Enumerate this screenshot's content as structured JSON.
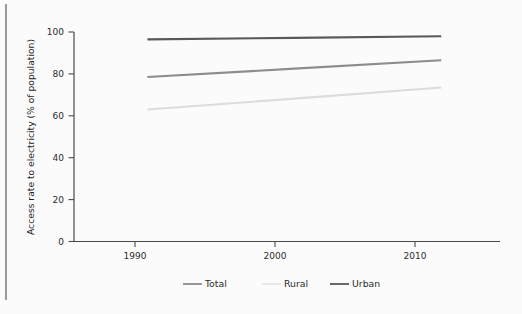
{
  "chart_data": {
    "type": "line",
    "title": "",
    "xlabel": "",
    "ylabel": "Access rate to electricity (% of population)",
    "x": [
      1990,
      2000,
      2010
    ],
    "xlim": [
      1985,
      2014
    ],
    "ylim": [
      0,
      100
    ],
    "xticks": [
      "1990",
      "2000",
      "2010"
    ],
    "yticks": [
      "0",
      "20",
      "40",
      "60",
      "80",
      "100"
    ],
    "grid": false,
    "legend_position": "bottom",
    "series": [
      {
        "name": "Total",
        "values": [
          78.5,
          82.5,
          86.5
        ],
        "color": "#8c8c8c"
      },
      {
        "name": "Rural",
        "values": [
          63.0,
          68.2,
          73.5
        ],
        "color": "#dcdcdc"
      },
      {
        "name": "Urban",
        "values": [
          96.5,
          97.2,
          98.0
        ],
        "color": "#59595b"
      }
    ]
  },
  "axis": {
    "ylabel": "Access rate to electricity (% of population)",
    "ytick_100": "100",
    "ytick_80": "80",
    "ytick_60": "60",
    "ytick_40": "40",
    "ytick_20": "20",
    "ytick_0": "0",
    "xtick_1990": "1990",
    "xtick_2000": "2000",
    "xtick_2010": "2010"
  },
  "legend": {
    "items": [
      {
        "label": "Total",
        "color": "#8c8c8c",
        "swatch": true
      },
      {
        "label": "Rural",
        "color": "#e6e6e6",
        "swatch": true
      },
      {
        "label": "Urban",
        "color": "#59595b",
        "swatch": true
      }
    ]
  },
  "colors": {
    "background": "#fbfbfb",
    "axis": "#4a4a4a",
    "text": "#2b2b2b",
    "rule": "#9a9a9a"
  }
}
